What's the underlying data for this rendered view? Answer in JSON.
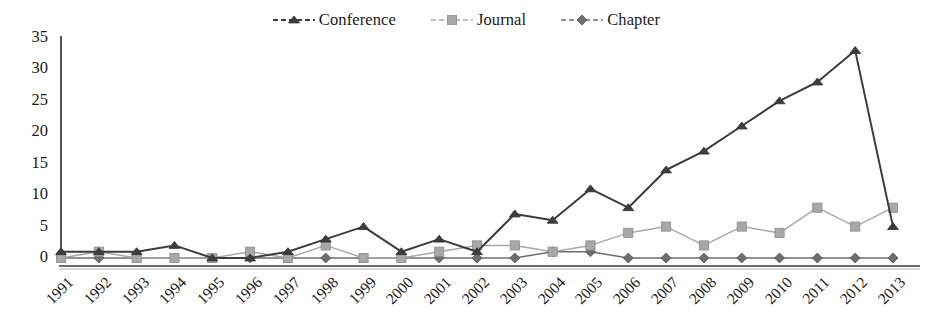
{
  "chart_data": {
    "type": "line",
    "title": "",
    "subtitle": "",
    "xlabel": "",
    "ylabel": "",
    "categories": [
      "1991",
      "1992",
      "1993",
      "1994",
      "1995",
      "1996",
      "1997",
      "1998",
      "1999",
      "2000",
      "2001",
      "2002",
      "2003",
      "2004",
      "2005",
      "2006",
      "2007",
      "2008",
      "2009",
      "2010",
      "2011",
      "2012",
      "2013"
    ],
    "ylim": [
      0,
      35
    ],
    "yticks": [
      0,
      5,
      10,
      15,
      20,
      25,
      30,
      35
    ],
    "ytick_labels": [
      "0",
      "5",
      "10",
      "15",
      "20",
      "25",
      "30",
      "35"
    ],
    "grid": false,
    "legend_position": "top-center",
    "series": [
      {
        "name": "Conference",
        "marker": "triangle",
        "color": "#3d3d3d",
        "values": [
          1,
          1,
          1,
          2,
          0,
          0,
          1,
          3,
          5,
          1,
          3,
          1,
          7,
          6,
          11,
          8,
          14,
          17,
          21,
          25,
          28,
          33,
          5
        ]
      },
      {
        "name": "Journal",
        "marker": "square",
        "color": "#a8a8a8",
        "values": [
          0,
          1,
          0,
          0,
          0,
          1,
          0,
          2,
          0,
          0,
          1,
          2,
          2,
          1,
          2,
          4,
          5,
          2,
          5,
          4,
          8,
          5,
          8
        ]
      },
      {
        "name": "Chapter",
        "marker": "diamond",
        "color": "#6e6e6e",
        "values": [
          0,
          0,
          0,
          0,
          0,
          0,
          0,
          0,
          0,
          0,
          0,
          0,
          0,
          1,
          1,
          0,
          0,
          0,
          0,
          0,
          0,
          0,
          0
        ]
      }
    ]
  },
  "legend": {
    "entries": [
      {
        "label": "Conference",
        "marker": "triangle",
        "color": "#3d3d3d"
      },
      {
        "label": "Journal",
        "marker": "square",
        "color": "#a8a8a8"
      },
      {
        "label": "Chapter",
        "marker": "diamond",
        "color": "#6e6e6e"
      }
    ]
  },
  "axis": {
    "y_color": "#2b2b2b",
    "x_color": "#6b6b6b"
  }
}
